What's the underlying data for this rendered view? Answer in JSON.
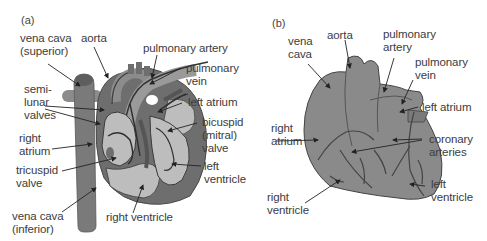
{
  "figure": {
    "panels": [
      {
        "id": "a",
        "label": "(a)",
        "description": "Internal cross-section of the heart",
        "labels": {
          "vena_cava_superior_1": "vena cava",
          "vena_cava_superior_2": "(superior)",
          "aorta": "aorta",
          "pulmonary_artery": "pulmonary artery",
          "pulmonary_vein_1": "pulmonary",
          "pulmonary_vein_2": "vein",
          "semilunar_1": "semi-",
          "semilunar_2": "lunar",
          "semilunar_3": "valves",
          "left_atrium": "left atrium",
          "bicuspid_1": "bicuspid",
          "bicuspid_2": "(mitral)",
          "bicuspid_3": "valve",
          "right_atrium_1": "right",
          "right_atrium_2": "atrium",
          "tricuspid_1": "tricuspid",
          "tricuspid_2": "valve",
          "left_ventricle_1": "left",
          "left_ventricle_2": "ventricle",
          "vena_cava_inferior_1": "vena cava",
          "vena_cava_inferior_2": "(inferior)",
          "right_ventricle": "right ventricle"
        }
      },
      {
        "id": "b",
        "label": "(b)",
        "description": "External view of the heart",
        "labels": {
          "vena_cava_1": "vena",
          "vena_cava_2": "cava",
          "aorta": "aorta",
          "pulmonary_artery_1": "pulmonary",
          "pulmonary_artery_2": "artery",
          "pulmonary_vein_1": "pulmonary",
          "pulmonary_vein_2": "vein",
          "left_atrium": "left atrium",
          "right_atrium_1": "right",
          "right_atrium_2": "atrium",
          "coronary_1": "coronary",
          "coronary_2": "arteries",
          "left_ventricle_1": "left",
          "left_ventricle_2": "ventricle",
          "right_ventricle_1": "right",
          "right_ventricle_2": "ventricle"
        }
      }
    ],
    "colors": {
      "dark_tissue": "#6e6e6e",
      "mid_tissue": "#8c8c8c",
      "light_chamber": "#bdbdbd",
      "outline": "#3a3a3a",
      "external_heart": "#8a8a8a"
    }
  }
}
